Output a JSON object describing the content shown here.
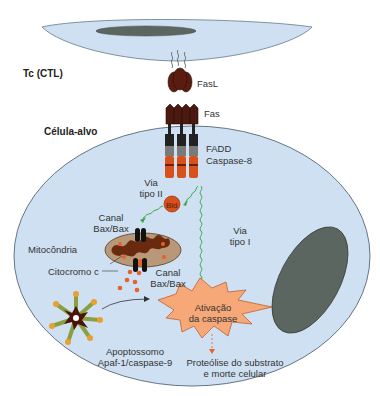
{
  "diagram": {
    "type": "biological-pathway",
    "cells": {
      "effector": {
        "label": "Tc (CTL)",
        "fill": "#cfe0f2",
        "nucleus_fill": "#5c6660"
      },
      "target": {
        "label": "Célula-alvo",
        "fill": "#cfe0f2",
        "nucleus_fill": "#5c6660"
      }
    },
    "molecules": {
      "fasl": "FasL",
      "fas": "Fas",
      "fadd": "FADD",
      "caspase8": "Caspase-8",
      "bid": "Bid"
    },
    "pathways": {
      "type2_line1": "Via",
      "type2_line2": "tipo II",
      "type1_line1": "Via",
      "type1_line2": "tipo I"
    },
    "organelles": {
      "channel_top_line1": "Canal",
      "channel_top_line2": "Bax/Bax",
      "mitochondria": "Mitocôndria",
      "cytochrome": "Citocromo c",
      "channel_bottom_line1": "Canal",
      "channel_bottom_line2": "Bax/Bax"
    },
    "apoptosome": {
      "line1": "Apoptossomo",
      "line2": "Apaf-1/caspase-9"
    },
    "activation": {
      "line1": "Ativação",
      "line2": "da caspase",
      "fill": "#f6a878"
    },
    "outcome": {
      "line1": "Proteólise do substrato",
      "line2": "e morte celular"
    },
    "colors": {
      "receptor_dark": "#4a1a10",
      "caspase_orange": "#d8501a",
      "arrow_green": "#3aa84a",
      "cytochrome_dot": "#e8602a"
    }
  }
}
